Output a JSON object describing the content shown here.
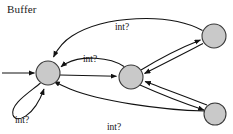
{
  "diagram": {
    "title": "Buffer",
    "type": "state-transition-automaton",
    "background_color": "#ffffff",
    "node_fill_color": "#c9c9c9",
    "node_stroke_color": "#3a3a3a",
    "edge_color": "#121212",
    "label_color": "#141414",
    "nodes": [
      {
        "id": "s0",
        "name": "state-node-left",
        "cx": 48,
        "cy": 73,
        "r": 12
      },
      {
        "id": "s1",
        "name": "state-node-middle",
        "cx": 131,
        "cy": 77,
        "r": 12
      },
      {
        "id": "s2",
        "name": "state-node-top-right",
        "cx": 214,
        "cy": 36,
        "r": 12
      },
      {
        "id": "s3",
        "name": "state-node-bottom-right",
        "cx": 215,
        "cy": 114,
        "r": 11
      }
    ],
    "start_arrow": {
      "name": "start-arrow",
      "from_x": 2,
      "from_y": 73,
      "to_x": 36,
      "to_y": 73
    },
    "edges": [
      {
        "id": "e1",
        "name": "edge-top-right-to-left",
        "from": "s2",
        "to": "s0",
        "label": "int?",
        "label_x": 122,
        "label_y": 30
      },
      {
        "id": "e2",
        "name": "edge-middle-to-left-curved",
        "from": "s1",
        "to": "s0",
        "label": "int?",
        "label_x": 90,
        "label_y": 62
      },
      {
        "id": "e3",
        "name": "edge-left-to-middle-straight",
        "from": "s0",
        "to": "s1",
        "label": "",
        "label_x": 0,
        "label_y": 0
      },
      {
        "id": "e4",
        "name": "edge-self-loop-left",
        "from": "s0",
        "to": "s0",
        "label": "int?",
        "label_x": 22,
        "label_y": 123
      },
      {
        "id": "e5",
        "name": "edge-bottom-right-to-left",
        "from": "s3",
        "to": "s0",
        "label": "int?",
        "label_x": 114,
        "label_y": 130
      },
      {
        "id": "e6",
        "name": "edge-middle-to-top-right",
        "from": "s1",
        "to": "s2",
        "label": "",
        "label_x": 0,
        "label_y": 0
      },
      {
        "id": "e7",
        "name": "edge-top-right-to-middle",
        "from": "s2",
        "to": "s1",
        "label": "",
        "label_x": 0,
        "label_y": 0
      },
      {
        "id": "e8",
        "name": "edge-middle-to-bottom-right",
        "from": "s1",
        "to": "s3",
        "label": "",
        "label_x": 0,
        "label_y": 0
      },
      {
        "id": "e9",
        "name": "edge-bottom-right-to-middle",
        "from": "s3",
        "to": "s1",
        "label": "",
        "label_x": 0,
        "label_y": 0
      }
    ],
    "labels": [
      {
        "name": "edge-label-top",
        "text": "int?"
      },
      {
        "name": "edge-label-upper-middle",
        "text": "int?"
      },
      {
        "name": "edge-label-self-loop",
        "text": "int?"
      },
      {
        "name": "edge-label-bottom",
        "text": "int?"
      }
    ]
  }
}
